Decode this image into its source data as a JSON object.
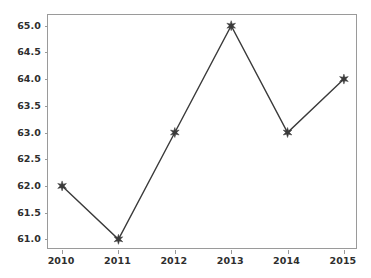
{
  "chart_data": {
    "type": "line",
    "title": "",
    "xlabel": "",
    "ylabel": "",
    "x": [
      2010,
      2011,
      2012,
      2013,
      2014,
      2015
    ],
    "categories": [
      "2010",
      "2011",
      "2012",
      "2013",
      "2014",
      "2015"
    ],
    "values": [
      62.0,
      61.0,
      63.0,
      65.0,
      63.0,
      64.0
    ],
    "series": [
      {
        "name": "",
        "values": [
          62.0,
          61.0,
          63.0,
          65.0,
          63.0,
          64.0
        ]
      }
    ],
    "xlim": [
      2009.75,
      2015.25
    ],
    "ylim": [
      60.8,
      65.2
    ],
    "xticks": [
      2010,
      2011,
      2012,
      2013,
      2014,
      2015
    ],
    "xticklabels": [
      "2010",
      "2011",
      "2012",
      "2013",
      "2014",
      "2015"
    ],
    "yticks": [
      61.0,
      61.5,
      62.0,
      62.5,
      63.0,
      63.5,
      64.0,
      64.5,
      65.0
    ],
    "yticklabels": [
      "61.0",
      "61.5",
      "62.0",
      "62.5",
      "63.0",
      "63.5",
      "64.0",
      "64.5",
      "65.0"
    ],
    "grid": false,
    "legend": null,
    "legend_position": "none",
    "marker": "star",
    "line_color": "#3a3a3a",
    "marker_color": "#3a3a3a",
    "background_color": "#ffffff",
    "axes_color": "#9a9a9a",
    "tick_label_color": "#2e2e2e"
  }
}
